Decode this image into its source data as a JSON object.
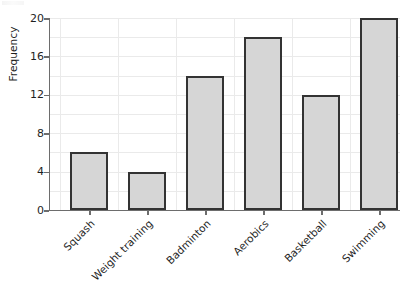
{
  "chart_data": {
    "type": "bar",
    "title": "",
    "subtitle": "",
    "xlabel": "",
    "ylabel": "Frequency",
    "categories": [
      "Squash",
      "Weight training",
      "Badminton",
      "Aerobics",
      "Basketball",
      "Swimming"
    ],
    "values": [
      6,
      4,
      14,
      18,
      12,
      20
    ],
    "ylim": [
      0,
      20
    ],
    "y_major_ticks": [
      0,
      4,
      8,
      12,
      16,
      20
    ],
    "y_minor_gridlines": [
      2,
      6,
      10,
      14,
      18
    ],
    "grid": true,
    "legend": "none",
    "bar_fill_color": "#d6d6d6",
    "bar_edge_color": "#333333",
    "grid_color": "#eaeaea",
    "axis_color": "#6d6d6d",
    "text_color": "#1f1f1f",
    "background_color": "#ffffff",
    "category_label_rotation": "-45"
  },
  "axis": {
    "y_tick_labels": [
      "0",
      "4",
      "8",
      "12",
      "16",
      "20"
    ]
  }
}
